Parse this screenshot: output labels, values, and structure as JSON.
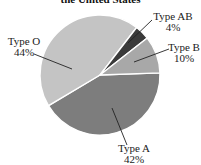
{
  "chart_data": {
    "type": "pie",
    "title": "the United States",
    "categories": [
      "Type A",
      "Type O",
      "Type AB",
      "Type B"
    ],
    "values": [
      42,
      44,
      4,
      10
    ],
    "value_labels": [
      "42%",
      "44%",
      "4%",
      "10%"
    ],
    "colors": [
      "#7d7d7d",
      "#c4c4c4",
      "#3a3a3a",
      "#a8a8a8"
    ],
    "legend": "none (callout labels)",
    "grid": false
  },
  "labels": {
    "type_o": {
      "name": "Type O",
      "pct": "44%"
    },
    "type_ab": {
      "name": "Type AB",
      "pct": "4%"
    },
    "type_b": {
      "name": "Type B",
      "pct": "10%"
    },
    "type_a": {
      "name": "Type A",
      "pct": "42%"
    }
  }
}
